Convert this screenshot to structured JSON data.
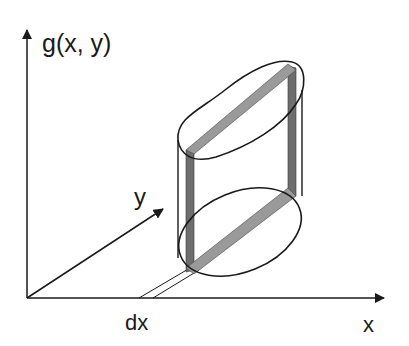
{
  "diagram": {
    "labels": {
      "vertical_axis": "g(x, y)",
      "x_axis": "x",
      "y_axis": "y",
      "slab_width": "dx"
    },
    "colors": {
      "line": "#1a1a1a",
      "slab_fill": "#8c8c8c",
      "slab_dark": "#6e6e6e",
      "background": "#ffffff"
    }
  }
}
